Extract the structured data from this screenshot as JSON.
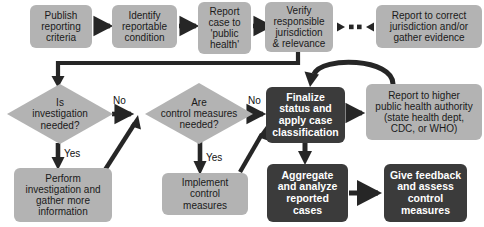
{
  "diagram": {
    "palette": {
      "light_node": "#b3b3b3",
      "dark_node": "#3b3b3b",
      "connector": "#262626",
      "background": "#ffffff",
      "light_text": "#1a1a1a",
      "dark_text": "#ffffff"
    },
    "nodes": [
      {
        "id": "publish",
        "shape": "rounded-rect",
        "style": "light",
        "label": "Publish\nreporting\ncriteria"
      },
      {
        "id": "identify",
        "shape": "rounded-rect",
        "style": "light",
        "label": "Identify\nreportable\ncondition"
      },
      {
        "id": "report_case",
        "shape": "rounded-rect",
        "style": "light",
        "label": "Report\ncase to\n'public\nhealth'"
      },
      {
        "id": "verify",
        "shape": "rounded-rect",
        "style": "light",
        "label": "Verify\nresponsible\njurisdiction\n& relevance"
      },
      {
        "id": "report_correct",
        "shape": "rounded-rect",
        "style": "light",
        "label": "Report to correct\njurisdiction and/or\ngather evidence"
      },
      {
        "id": "inv_needed",
        "shape": "diamond",
        "style": "light",
        "label": "Is\ninvestigation\nneeded?"
      },
      {
        "id": "ctrl_needed",
        "shape": "diamond",
        "style": "light",
        "label": "Are\ncontrol measures\nneeded?"
      },
      {
        "id": "finalize",
        "shape": "rounded-rect",
        "style": "dark",
        "label": "Finalize\nstatus and\napply case\nclassification"
      },
      {
        "id": "report_higher",
        "shape": "rounded-rect",
        "style": "light",
        "label": "Report to higher\npublic health authority\n(state health dept,\nCDC, or WHO)"
      },
      {
        "id": "perform_inv",
        "shape": "rounded-rect",
        "style": "light",
        "label": "Perform\ninvestigation and\ngather more\ninformation"
      },
      {
        "id": "implement",
        "shape": "rounded-rect",
        "style": "light",
        "label": "Implement\ncontrol\nmeasures"
      },
      {
        "id": "aggregate",
        "shape": "rounded-rect",
        "style": "dark",
        "label": "Aggregate\nand analyze\nreported\ncases"
      },
      {
        "id": "feedback",
        "shape": "rounded-rect",
        "style": "dark",
        "label": "Give feedback\nand assess\ncontrol\nmeasures"
      }
    ],
    "edge_labels": [
      {
        "id": "no-1",
        "label": "No"
      },
      {
        "id": "no-2",
        "label": "No"
      },
      {
        "id": "yes-1",
        "label": "Yes"
      },
      {
        "id": "yes-2",
        "label": "Yes"
      }
    ],
    "edges": [
      {
        "from": "publish",
        "to": "identify",
        "kind": "arrow"
      },
      {
        "from": "identify",
        "to": "report_case",
        "kind": "arrow"
      },
      {
        "from": "report_case",
        "to": "verify",
        "kind": "arrow"
      },
      {
        "from": "verify",
        "to": "report_correct",
        "kind": "double-dotted-arrow"
      },
      {
        "from": "verify",
        "to": "inv_needed",
        "kind": "elbow-arrow"
      },
      {
        "from": "inv_needed",
        "to": "ctrl_needed",
        "kind": "arrow",
        "label": "No"
      },
      {
        "from": "inv_needed",
        "to": "perform_inv",
        "kind": "arrow",
        "label": "Yes"
      },
      {
        "from": "perform_inv",
        "to": "ctrl_needed",
        "kind": "diagonal-arrow"
      },
      {
        "from": "ctrl_needed",
        "to": "finalize",
        "kind": "arrow",
        "label": "No"
      },
      {
        "from": "ctrl_needed",
        "to": "implement",
        "kind": "arrow",
        "label": "Yes"
      },
      {
        "from": "implement",
        "to": "finalize",
        "kind": "diagonal-arrow"
      },
      {
        "from": "finalize",
        "to": "report_higher",
        "kind": "arrow"
      },
      {
        "from": "report_higher",
        "to": "finalize",
        "kind": "curved-arrow"
      },
      {
        "from": "finalize",
        "to": "aggregate",
        "kind": "arrow"
      },
      {
        "from": "aggregate",
        "to": "feedback",
        "kind": "arrow"
      }
    ]
  }
}
